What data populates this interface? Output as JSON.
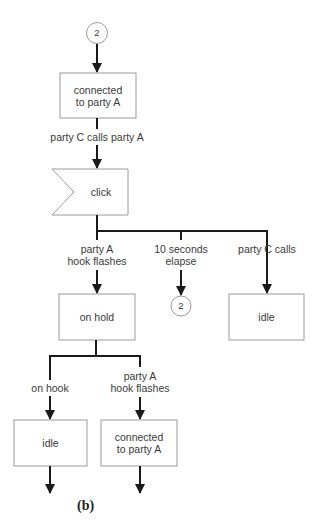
{
  "figure": {
    "caption": "(b)",
    "top_cutoff_text": "·········   ·············   ··················"
  },
  "connectors": {
    "top": "2",
    "mid": "2"
  },
  "states": {
    "connected_top": "connected\nto party A",
    "click": "click",
    "on_hold": "on hold",
    "idle_right": "idle",
    "idle_bottom": "idle",
    "connected_bottom": "connected\nto party A"
  },
  "transitions": {
    "c_calls_a": "party C calls party A",
    "a_hook_flashes_1": "party A\nhook flashes",
    "ten_seconds": "10 seconds\nelapse",
    "c_calls": "party C calls",
    "on_hook": "on hook",
    "a_hook_flashes_2": "party A\nhook flashes"
  },
  "colors": {
    "box_stroke": "#9a9a9a",
    "line": "#1a1a1a",
    "text": "#3a3a3a"
  }
}
